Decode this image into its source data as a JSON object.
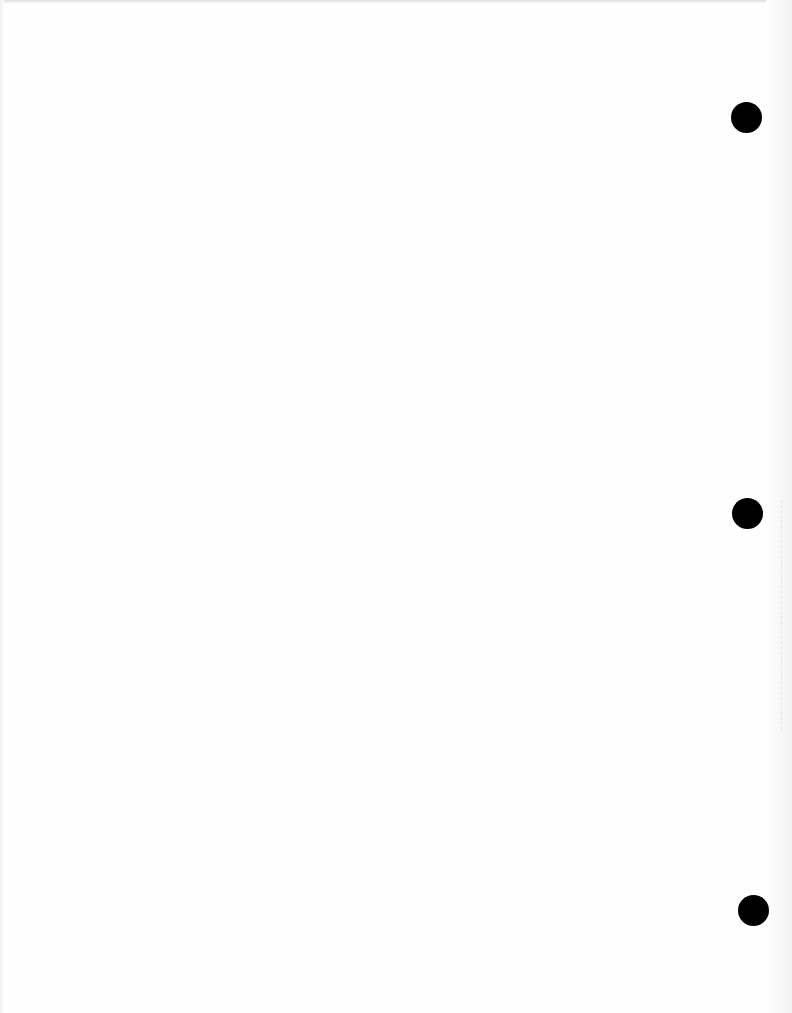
{
  "document": {
    "type": "blank scanned page",
    "background_color": "#fefefe",
    "text_content": ""
  },
  "punch_holes": [
    {
      "cx": 746,
      "cy": 117,
      "diameter": 31,
      "color": "#000000"
    },
    {
      "cx": 747,
      "cy": 513,
      "diameter": 31,
      "color": "#000000"
    },
    {
      "cx": 753,
      "cy": 910,
      "diameter": 31,
      "color": "#000000"
    }
  ]
}
